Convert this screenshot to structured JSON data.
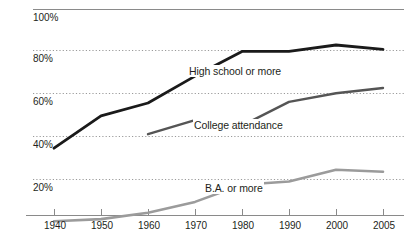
{
  "chart_data": {
    "type": "line",
    "title": "",
    "subtitle": "",
    "xlabel": "",
    "ylabel": "",
    "categories": [
      "1940",
      "1950",
      "1960",
      "1970",
      "1980",
      "1990",
      "2000",
      "2005"
    ],
    "x": [
      1940,
      1950,
      1960,
      1970,
      1980,
      1990,
      2000,
      2005
    ],
    "ylim": [
      0,
      100
    ],
    "xlim": [
      1940,
      2005
    ],
    "ytick_labels": [
      "100%",
      "80%",
      "60%",
      "40%",
      "20%"
    ],
    "yticks": [
      100,
      80,
      60,
      40,
      20
    ],
    "xtick_labels": [
      "1940",
      "1950",
      "1960",
      "1970",
      "1980",
      "1990",
      "2000",
      "2005"
    ],
    "grid": "horizontal-dotted",
    "legend_position": "inline-annotations",
    "series": [
      {
        "name": "High school or more",
        "color": "#1a1a1a",
        "values": [
          39,
          54,
          60,
          72.5,
          84,
          84,
          87,
          85
        ],
        "x": [
          1940,
          1950,
          1960,
          1970,
          1980,
          1990,
          2000,
          2005
        ]
      },
      {
        "name": "College attendance",
        "color": "#555555",
        "values": [
          null,
          null,
          45.5,
          52,
          49.5,
          60.5,
          64.5,
          67
        ],
        "x": [
          1940,
          1950,
          1960,
          1970,
          1980,
          1990,
          2000,
          2005
        ]
      },
      {
        "name": "B.A. or more",
        "color": "#9b9b9b",
        "values": [
          5,
          6,
          9,
          14,
          22,
          23.5,
          29,
          28
        ],
        "x": [
          1940,
          1950,
          1960,
          1970,
          1980,
          1990,
          2000,
          2005
        ]
      }
    ],
    "annotations": [
      {
        "text": "High school or more",
        "series": "High school or more"
      },
      {
        "text": "College attendance",
        "series": "College attendance"
      },
      {
        "text": "B.A. or more",
        "series": "B.A. or more"
      }
    ]
  },
  "colors": {
    "high_school_line": "#1a1a1a",
    "college_line": "#555555",
    "ba_line": "#9b9b9b",
    "grid": "#9a9a9a",
    "axis": "#8a8a8a",
    "text": "#231f20",
    "background": "#ffffff"
  },
  "y_axis": {
    "ticks": [
      {
        "label": "100%"
      },
      {
        "label": "80%"
      },
      {
        "label": "60%"
      },
      {
        "label": "40%"
      },
      {
        "label": "20%"
      }
    ]
  },
  "x_axis": {
    "ticks": [
      {
        "label": "1940"
      },
      {
        "label": "1950"
      },
      {
        "label": "1960"
      },
      {
        "label": "1970"
      },
      {
        "label": "1980"
      },
      {
        "label": "1990"
      },
      {
        "label": "2000"
      },
      {
        "label": "2005"
      }
    ]
  },
  "series_labels": {
    "high_school": "High school or more",
    "college": "College attendance",
    "ba": "B.A. or more"
  }
}
